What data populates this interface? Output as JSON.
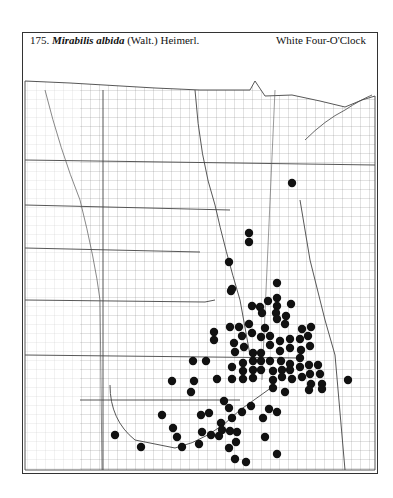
{
  "header": {
    "number": "175.",
    "scientific_name": "Mirabilis albida",
    "authority": "(Walt.) Heimerl.",
    "common_name": "White Four-O'Clock"
  },
  "map": {
    "region": "Great Plains (North Dakota, South Dakota, Nebraska, Kansas, Oklahoma, Texas panhandle, Minnesota, Iowa, Missouri, etc.)",
    "marker_symbol": "filled-black-circle",
    "marker_color": "#111111",
    "line_color": "#555555",
    "occurrence_points": [
      [
        292,
        183
      ],
      [
        249,
        233
      ],
      [
        249,
        242
      ],
      [
        229,
        262
      ],
      [
        232,
        289
      ],
      [
        231,
        291
      ],
      [
        277,
        283
      ],
      [
        277,
        298
      ],
      [
        268,
        301
      ],
      [
        291,
        304
      ],
      [
        252,
        306
      ],
      [
        260,
        307
      ],
      [
        277,
        306
      ],
      [
        262,
        313
      ],
      [
        276,
        313
      ],
      [
        286,
        316
      ],
      [
        277,
        319
      ],
      [
        230,
        327
      ],
      [
        239,
        327
      ],
      [
        249,
        324
      ],
      [
        265,
        328
      ],
      [
        285,
        324
      ],
      [
        302,
        329
      ],
      [
        311,
        327
      ],
      [
        242,
        336
      ],
      [
        252,
        333
      ],
      [
        261,
        337
      ],
      [
        270,
        336
      ],
      [
        280,
        341
      ],
      [
        290,
        339
      ],
      [
        300,
        339
      ],
      [
        308,
        336
      ],
      [
        214,
        332
      ],
      [
        214,
        340
      ],
      [
        234,
        343
      ],
      [
        244,
        347
      ],
      [
        253,
        353
      ],
      [
        261,
        353
      ],
      [
        270,
        345
      ],
      [
        280,
        351
      ],
      [
        290,
        348
      ],
      [
        301,
        350
      ],
      [
        310,
        346
      ],
      [
        235,
        352
      ],
      [
        193,
        361
      ],
      [
        206,
        361
      ],
      [
        243,
        363
      ],
      [
        253,
        361
      ],
      [
        261,
        361
      ],
      [
        270,
        361
      ],
      [
        281,
        361
      ],
      [
        290,
        364
      ],
      [
        300,
        358
      ],
      [
        309,
        365
      ],
      [
        318,
        365
      ],
      [
        232,
        367
      ],
      [
        243,
        371
      ],
      [
        253,
        370
      ],
      [
        261,
        370
      ],
      [
        273,
        371
      ],
      [
        282,
        370
      ],
      [
        290,
        370
      ],
      [
        300,
        367
      ],
      [
        310,
        374
      ],
      [
        320,
        374
      ],
      [
        172,
        381
      ],
      [
        194,
        381
      ],
      [
        217,
        379
      ],
      [
        232,
        379
      ],
      [
        243,
        379
      ],
      [
        253,
        378
      ],
      [
        273,
        380
      ],
      [
        282,
        377
      ],
      [
        292,
        379
      ],
      [
        302,
        377
      ],
      [
        311,
        384
      ],
      [
        322,
        384
      ],
      [
        348,
        380
      ],
      [
        191,
        392
      ],
      [
        273,
        388
      ],
      [
        285,
        392
      ],
      [
        309,
        390
      ],
      [
        322,
        389
      ],
      [
        224,
        401
      ],
      [
        251,
        406
      ],
      [
        229,
        408
      ],
      [
        269,
        409
      ],
      [
        209,
        413
      ],
      [
        201,
        415
      ],
      [
        162,
        415
      ],
      [
        242,
        412
      ],
      [
        277,
        412
      ],
      [
        232,
        418
      ],
      [
        263,
        418
      ],
      [
        221,
        423
      ],
      [
        173,
        428
      ],
      [
        222,
        430
      ],
      [
        230,
        431
      ],
      [
        202,
        432
      ],
      [
        237,
        432
      ],
      [
        211,
        435
      ],
      [
        219,
        436
      ],
      [
        115,
        435
      ],
      [
        177,
        437
      ],
      [
        265,
        437
      ],
      [
        236,
        442
      ],
      [
        199,
        444
      ],
      [
        141,
        447
      ],
      [
        182,
        447
      ],
      [
        229,
        448
      ],
      [
        277,
        454
      ],
      [
        235,
        459
      ],
      [
        246,
        462
      ]
    ]
  }
}
